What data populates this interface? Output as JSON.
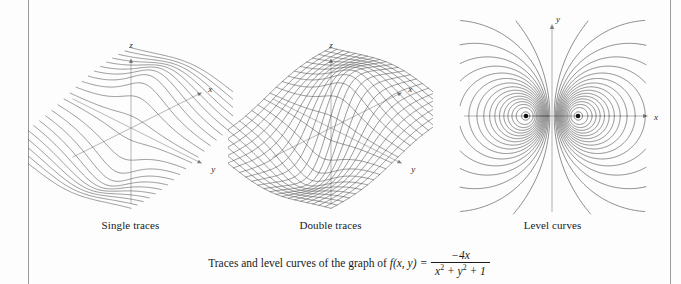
{
  "figure": {
    "panels": [
      {
        "id": "single-traces",
        "caption": "Single traces",
        "axes": {
          "x": "x",
          "y": "y",
          "z": "z"
        },
        "render": "surface-traces-one-direction"
      },
      {
        "id": "double-traces",
        "caption": "Double traces",
        "axes": {
          "x": "x",
          "y": "y",
          "z": "z"
        },
        "render": "surface-wireframe-mesh"
      },
      {
        "id": "level-curves",
        "caption": "Level curves",
        "axes": {
          "x": "x",
          "y": "y"
        },
        "render": "contour-dipole",
        "critical_points": [
          {
            "x": -1,
            "y": 0
          },
          {
            "x": 1,
            "y": 0
          }
        ]
      }
    ],
    "main_caption": {
      "lead": "Traces and level curves of the graph of ",
      "function_name": "f(x, y)",
      "equals": "=",
      "numerator": "−4x",
      "denominator_prefix": "x",
      "denominator": "x² + y² + 1"
    }
  },
  "chart_data": {
    "type": "line",
    "function": "f(x,y) = -4x / (x^2 + y^2 + 1)",
    "xlabel": "x",
    "ylabel": "y",
    "zlabel": "z",
    "xlim": [
      -3,
      3
    ],
    "ylim": [
      -3,
      3
    ],
    "zlim": [
      -2,
      2
    ],
    "grid": false,
    "legend": "none",
    "critical_points": [
      {
        "x": -1,
        "y": 0,
        "z": 2,
        "type": "maximum"
      },
      {
        "x": 1,
        "y": 0,
        "z": -2,
        "type": "minimum"
      }
    ],
    "level_values": [
      -1.8,
      -1.5,
      -1.2,
      -0.9,
      -0.6,
      -0.4,
      -0.25,
      -0.12,
      0,
      0.12,
      0.25,
      0.4,
      0.6,
      0.9,
      1.2,
      1.5,
      1.8
    ],
    "panels": [
      {
        "name": "Single traces",
        "trace_direction": "one",
        "trace_count": 21
      },
      {
        "name": "Double traces",
        "trace_direction": "both",
        "trace_count": 21
      },
      {
        "name": "Level curves",
        "contour_count": 34
      }
    ]
  }
}
